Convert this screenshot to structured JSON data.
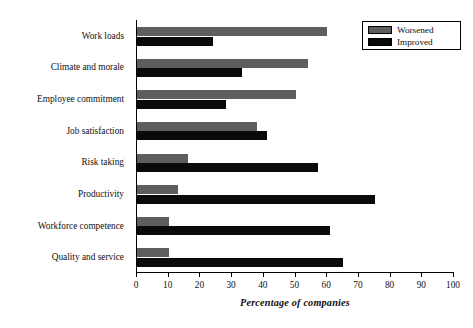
{
  "chart_data": {
    "type": "bar",
    "orientation": "horizontal",
    "title": "",
    "xlabel": "Percentage of companies",
    "ylabel": "",
    "xlim": [
      0,
      100
    ],
    "xticks": [
      0,
      10,
      20,
      30,
      40,
      50,
      60,
      70,
      80,
      90,
      100
    ],
    "grid": false,
    "legend_position": "top-right",
    "categories": [
      "Work loads",
      "Climate and morale",
      "Employee commitment",
      "Job satisfaction",
      "Risk taking",
      "Productivity",
      "Workforce competence",
      "Quality and service"
    ],
    "series": [
      {
        "name": "Worsened",
        "color": "#5e5e5e",
        "values": [
          60,
          54,
          50,
          38,
          16,
          13,
          10,
          10
        ]
      },
      {
        "name": "Improved",
        "color": "#0a0a0a",
        "values": [
          24,
          33,
          28,
          41,
          57,
          75,
          61,
          65
        ]
      }
    ]
  },
  "legend": {
    "items": [
      {
        "label": "Worsened"
      },
      {
        "label": "Improved"
      }
    ]
  },
  "axis": {
    "x_title": "Percentage of companies",
    "tick_labels": [
      "0",
      "10",
      "20",
      "30",
      "40",
      "50",
      "60",
      "70",
      "80",
      "90",
      "100"
    ]
  }
}
